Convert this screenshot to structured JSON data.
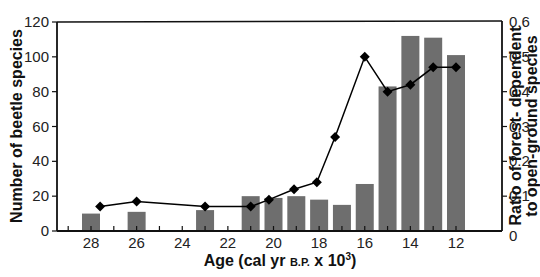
{
  "chart_data": {
    "type": "bar+line",
    "title": "",
    "xlabel": "Age (cal yr B.P. x 10³)",
    "xlabel_parts": {
      "main": "Age (cal yr ",
      "small": "B.P.",
      "tail": " x 10",
      "sup": "3",
      "close": ")"
    },
    "ylabel": "Number of beetle species",
    "y2label_line1": "Ratio of forest- dependent",
    "y2label_line2": "to open-ground species",
    "x_range": [
      29.5,
      11.5
    ],
    "x_ticks": [
      28,
      26,
      24,
      22,
      20,
      18,
      16,
      14,
      12
    ],
    "ylim": [
      0,
      120
    ],
    "y_ticks": [
      0,
      20,
      40,
      60,
      80,
      100,
      120
    ],
    "y2lim": [
      0,
      0.6
    ],
    "y2_ticks": [
      0,
      0.1,
      0.2,
      0.3,
      0.4,
      0.5,
      0.6
    ],
    "y2_tick_labels": [
      "0",
      "0.1",
      "0.2",
      "0.3",
      "0.4",
      "0.5",
      "0.6"
    ],
    "grid": false,
    "series": [
      {
        "name": "Number of beetle species",
        "type": "bar",
        "axis": "left",
        "color": "#6e6e6e",
        "x": [
          28,
          26,
          23,
          21,
          20,
          19,
          18,
          17,
          16,
          15,
          14,
          13,
          12
        ],
        "values": [
          10,
          11,
          12,
          20,
          19,
          20,
          18,
          15,
          27,
          83,
          112,
          111,
          101
        ]
      },
      {
        "name": "Ratio of forest-dependent to open-ground species",
        "type": "line",
        "axis": "right",
        "color": "#000000",
        "marker": "diamond",
        "x": [
          27.6,
          26.0,
          23.0,
          21.0,
          20.2,
          19.1,
          18.1,
          17.3,
          16.0,
          15.0,
          14.0,
          13.0,
          12.0
        ],
        "values": [
          0.07,
          0.085,
          0.07,
          0.07,
          0.09,
          0.12,
          0.14,
          0.27,
          0.5,
          0.4,
          0.42,
          0.47,
          0.47
        ]
      }
    ]
  }
}
